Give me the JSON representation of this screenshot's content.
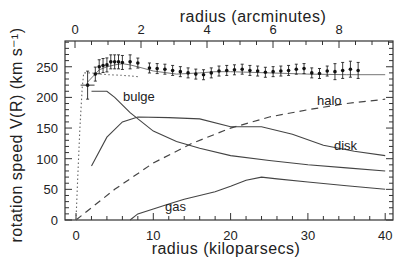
{
  "chart_data": {
    "type": "line",
    "title": "",
    "xlabel": "radius (kiloparsecs)",
    "x2label": "radius (arcminutes)",
    "ylabel": "rotation speed V(R) (km s⁻¹)",
    "xlim": [
      -1.5,
      41
    ],
    "ylim": [
      0,
      290
    ],
    "x_ticks": [
      0,
      10,
      20,
      30,
      40
    ],
    "x2_ticks": [
      0,
      2,
      4,
      6,
      8
    ],
    "y_ticks": [
      0,
      50,
      100,
      150,
      200,
      250
    ],
    "grid": false,
    "legend": "inline labels",
    "series": [
      {
        "name": "total model",
        "style": "solid",
        "x": [
          1.5,
          3,
          4,
          5,
          6,
          7,
          8,
          10,
          13,
          16,
          18,
          20,
          25,
          30,
          35,
          40
        ],
        "y": [
          225,
          245,
          250,
          253,
          255,
          253,
          250,
          243,
          238,
          240,
          242,
          242,
          240,
          238,
          237,
          237
        ]
      },
      {
        "name": "bulge",
        "style": "solid",
        "x": [
          2,
          4,
          5,
          7,
          10,
          13,
          16,
          20,
          25,
          30,
          35,
          40
        ],
        "y": [
          210,
          210,
          200,
          175,
          145,
          128,
          117,
          105,
          97,
          90,
          85,
          80
        ]
      },
      {
        "name": "disk",
        "style": "solid",
        "x": [
          2,
          4,
          6,
          8,
          12,
          16,
          20,
          24,
          28,
          32,
          36,
          40
        ],
        "y": [
          88,
          135,
          160,
          168,
          167,
          165,
          152,
          152,
          140,
          122,
          112,
          105
        ]
      },
      {
        "name": "halo",
        "style": "dashed",
        "x": [
          0,
          5,
          10,
          15,
          20,
          25,
          30,
          35,
          40
        ],
        "y": [
          0,
          50,
          93,
          125,
          150,
          168,
          180,
          190,
          197
        ]
      },
      {
        "name": "gas",
        "style": "solid",
        "x": [
          7,
          8,
          10,
          12,
          14,
          16,
          18,
          20,
          22,
          24,
          26,
          30,
          35,
          40
        ],
        "y": [
          0,
          10,
          18,
          26,
          34,
          40,
          46,
          55,
          65,
          70,
          67,
          62,
          56,
          50
        ]
      },
      {
        "name": "inner fit",
        "style": "dotted",
        "x": [
          0,
          0.2,
          0.5,
          0.8,
          1,
          2,
          4,
          6,
          8
        ],
        "y": [
          0,
          60,
          150,
          215,
          240,
          240,
          237,
          236,
          234
        ]
      },
      {
        "name": "observed",
        "style": "points-with-errorbars",
        "x": [
          1.5,
          2.5,
          3,
          3.5,
          4,
          4.5,
          5,
          5.5,
          6,
          7,
          8,
          9.5,
          10.5,
          11.5,
          12.5,
          13.5,
          14.5,
          15.5,
          16.5,
          17.5,
          18.5,
          19.5,
          20.5,
          21.5,
          22.5,
          23.5,
          24.5,
          25.5,
          26.5,
          27.5,
          28.5,
          29.5,
          30.5,
          31.5,
          32.5,
          33.5,
          34.5,
          35.5,
          36.5
        ],
        "y": [
          220,
          238,
          250,
          252,
          253,
          258,
          258,
          258,
          257,
          258,
          256,
          248,
          247,
          246,
          244,
          242,
          240,
          238,
          237,
          240,
          243,
          244,
          245,
          246,
          244,
          243,
          241,
          242,
          243,
          244,
          246,
          247,
          240,
          239,
          243,
          242,
          244,
          246,
          244
        ]
      }
    ],
    "annotations": [
      "bulge",
      "halo",
      "disk",
      "gas"
    ]
  },
  "labels": {
    "x_axis_title": "radius (kiloparsecs)",
    "x2_axis_title": "radius (arcminutes)",
    "y_axis_title": "rotation speed V(R) (km s⁻¹)",
    "bulge": "bulge",
    "halo": "halo",
    "disk": "disk",
    "gas": "gas"
  }
}
